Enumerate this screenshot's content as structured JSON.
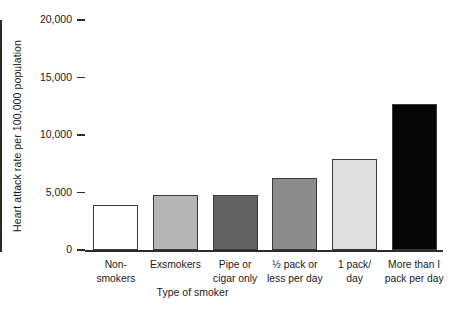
{
  "chart_data": {
    "type": "bar",
    "title": "",
    "subtitle": "",
    "xlabel": "Type of smoker",
    "ylabel": "Heart attack rate per 100,000 population",
    "categories": [
      "Non-smokers",
      "Exsmokers",
      "Pipe or cigar only",
      "½ pack or less per day",
      "1 pack/day",
      "More than I pack per day"
    ],
    "category_lines": [
      [
        "Non-",
        "smokers"
      ],
      [
        "Exsmokers"
      ],
      [
        "Pipe or",
        "cigar only"
      ],
      [
        "½ pack or",
        "less per day"
      ],
      [
        "1 pack/",
        "day"
      ],
      [
        "More than I",
        "pack per day"
      ]
    ],
    "values": [
      3900,
      4800,
      4800,
      6300,
      7900,
      12700
    ],
    "ylim": [
      0,
      20000
    ],
    "ytick_values": [
      0,
      5000,
      10000,
      15000,
      20000
    ],
    "ytick_labels": [
      "0",
      "5,000",
      "10,000",
      "15,000",
      "20,000"
    ],
    "grid": false,
    "legend": "none",
    "bar_colors": [
      "#ffffff",
      "#b5b5b5",
      "#636363",
      "#8c8c8c",
      "#dedede",
      "#050505"
    ],
    "bar_border_color": "#3a3a3a",
    "axis_color": "#2b2b2b",
    "background_color": "#ffffff"
  },
  "axes": {
    "y_title": "Heart attack rate per 100,000 population",
    "x_title": "Type of smoker"
  }
}
